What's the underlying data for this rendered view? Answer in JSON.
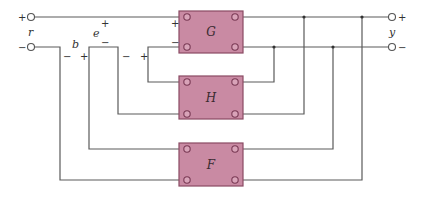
{
  "diagram": {
    "type": "two-port network interconnection",
    "colors": {
      "box_fill": "#c98aa3",
      "box_stroke": "#8a4a63",
      "wire": "#5a5a5a"
    },
    "input": {
      "label": "r",
      "plus": "+",
      "minus": "−"
    },
    "output": {
      "label": "y",
      "plus": "+",
      "minus": "−"
    },
    "blocks": [
      {
        "id": "G",
        "label": "G",
        "input_plus": "+",
        "input_minus": "−"
      },
      {
        "id": "H",
        "label": "H"
      },
      {
        "id": "F",
        "label": "F"
      }
    ],
    "intermediate_signals": [
      {
        "label": "b",
        "left_sign": "−",
        "right_sign": "+"
      },
      {
        "label": "e",
        "top_sign": "+",
        "bottom_sign": "−"
      }
    ],
    "loop_signs": {
      "h_minus": "−",
      "h_plus": "+"
    }
  }
}
